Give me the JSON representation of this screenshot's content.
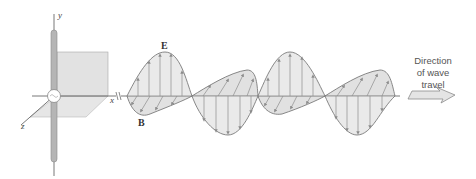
{
  "figure": {
    "axes": {
      "y_label": "y",
      "x_label": "x",
      "z_label": "z"
    },
    "fields": {
      "electric_label": "E",
      "magnetic_label": "B"
    },
    "direction_caption": [
      "Direction",
      "of wave",
      "travel"
    ],
    "colors": {
      "fill": "#dcdcdc",
      "stroke": "#7a7a7a",
      "arrow": "#8c8c8c",
      "rod": "#b5b5b5"
    }
  }
}
